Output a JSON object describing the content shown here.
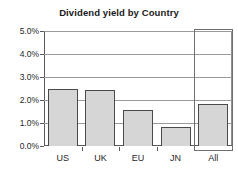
{
  "chart_data": {
    "type": "bar",
    "title": "Dividend yield by Country",
    "xlabel": "",
    "ylabel": "",
    "categories": [
      "US",
      "UK",
      "EU",
      "JN",
      "All"
    ],
    "values": [
      2.48,
      2.43,
      1.57,
      0.83,
      1.83
    ],
    "value_labels": [
      "2.48%",
      "2.43%",
      "1.57%",
      "0.83%",
      "1.83%"
    ],
    "ylim": [
      0.0,
      5.0
    ],
    "ytick_values": [
      0.0,
      1.0,
      2.0,
      3.0,
      4.0,
      5.0
    ],
    "ytick_labels": [
      "0.0%",
      "1.0%",
      "2.0%",
      "3.0%",
      "4.0%",
      "5.0%"
    ],
    "grid": true,
    "grid_axis": "y",
    "legend": false,
    "legend_position": "none",
    "bar_fill_color": "#d6d6d6",
    "bar_border_color": "#4a4a4a",
    "axis_color": "#5a5a5a",
    "gridline_color": "#9a9a9a",
    "background_color": "#ffffff",
    "highlighted_category": "All",
    "selection_border_color": "#6f6f6f",
    "annotations": []
  },
  "icons": {
    "selection_handle": "selection-box"
  }
}
